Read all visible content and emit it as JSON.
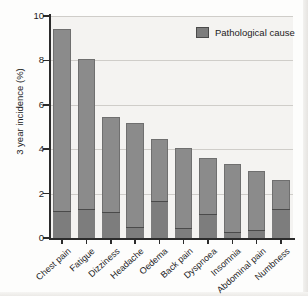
{
  "chart_data": {
    "type": "bar",
    "title": "",
    "subtitle": "",
    "xlabel": "",
    "ylabel": "3 year incidence (%)",
    "ylim": [
      0,
      10
    ],
    "yticks": [
      0,
      2,
      4,
      6,
      8,
      10
    ],
    "ytick_labels": [
      "0",
      "2",
      "4",
      "6",
      "8",
      "10"
    ],
    "grid": true,
    "grid_axis": "y",
    "stacked": true,
    "legend": {
      "position": "top-right",
      "entries": [
        {
          "label": "Pathological cause",
          "color": "#7d7d7d"
        }
      ]
    },
    "categories": [
      "Chest pain",
      "Fatigue",
      "Dizziness",
      "Headache",
      "Oedema",
      "Back pain",
      "Dyspnoea",
      "Insomnia",
      "Abdominal pain",
      "Numbness"
    ],
    "series": [
      {
        "name": "Pathological cause",
        "color": "#7d7d7d",
        "values": [
          1.2,
          1.3,
          1.15,
          0.5,
          1.65,
          0.45,
          1.1,
          0.25,
          0.35,
          1.3
        ]
      },
      {
        "name": "Total 3 year incidence",
        "color": "#8b8b8b",
        "values": [
          9.4,
          8.05,
          5.45,
          5.2,
          4.45,
          4.05,
          3.6,
          3.35,
          3.0,
          2.6
        ]
      }
    ],
    "totals": [
      9.4,
      8.05,
      5.45,
      5.2,
      4.45,
      4.05,
      3.6,
      3.35,
      3.0,
      2.6
    ],
    "colors": {
      "bar_fill": "#8b8b8b",
      "bar_stroke": "#6f6f6f",
      "pathological_fill": "#7d7d7d",
      "divider": "#4a4a4a",
      "plot_background": "#f4f3f1",
      "gridline": "#cfcdc9",
      "axis": "#2b2b2b",
      "text": "#1c1c1c"
    }
  }
}
